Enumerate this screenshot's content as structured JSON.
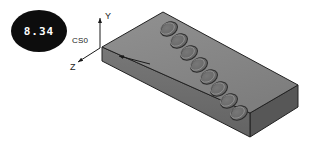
{
  "figure": {
    "title": "",
    "background_color": "#ffffff",
    "width": 315,
    "height": 156
  },
  "badge": {
    "label": "8.34",
    "shape": "ellipse",
    "fill_color": "#0d0d0d",
    "text_color": "#ffffff",
    "center": {
      "x": 39,
      "y": 31
    },
    "radius": {
      "rx": 28,
      "ry": 21
    }
  },
  "coordinate_system": {
    "name": "CS0",
    "origin": {
      "x": 100,
      "y": 48
    },
    "axes": [
      {
        "name": "Y",
        "label": "Y",
        "direction": "up",
        "tip": {
          "x": 100,
          "y": 17
        },
        "label_pos": {
          "x": 104,
          "y": 18
        }
      },
      {
        "name": "Z",
        "label": "Z",
        "direction": "down-left",
        "tip": {
          "x": 76,
          "y": 63
        },
        "label_pos": {
          "x": 74,
          "y": 68
        }
      },
      {
        "name": "X",
        "label": "",
        "direction": "up-right",
        "tip": {
          "x": 118,
          "y": 57
        },
        "label_pos": {
          "x": 0,
          "y": 0
        }
      }
    ],
    "label_pos": {
      "x": 72,
      "y": 43
    },
    "line_color": "#1a1a1a"
  },
  "part": {
    "name": "perforated-plate",
    "type": "isometric-rectangular-slab",
    "top_face_color": "#8a8a8a",
    "front_face_color": "#6f6f6f",
    "right_face_color": "#575757",
    "edge_color": "#222222",
    "top_face_points": "102,47 163,12 298,85 250,113",
    "front_face_points": "102,47 102,61 250,137 250,113",
    "right_face_points": "250,113 250,137 298,107 298,85",
    "hole_count": 8,
    "hole_color": "#6b6b6b",
    "hole_edge_color": "#2a2a2a",
    "holes": [
      {
        "index": 1,
        "cx": 169,
        "cy": 29,
        "rx": 9,
        "ry": 6.5
      },
      {
        "index": 2,
        "cx": 179,
        "cy": 41,
        "rx": 9,
        "ry": 6.5
      },
      {
        "index": 3,
        "cx": 189,
        "cy": 53,
        "rx": 9,
        "ry": 6.5
      },
      {
        "index": 4,
        "cx": 199,
        "cy": 65,
        "rx": 9,
        "ry": 6.5
      },
      {
        "index": 5,
        "cx": 209,
        "cy": 77,
        "rx": 9,
        "ry": 6.5
      },
      {
        "index": 6,
        "cx": 219,
        "cy": 89,
        "rx": 9,
        "ry": 6.5
      },
      {
        "index": 7,
        "cx": 229,
        "cy": 101,
        "rx": 9,
        "ry": 6.5
      },
      {
        "index": 8,
        "cx": 239,
        "cy": 113,
        "rx": 9,
        "ry": 6.5
      }
    ]
  }
}
